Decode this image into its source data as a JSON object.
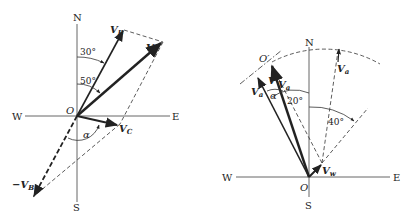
{
  "left_diagram": {
    "compass": {
      "north": "N",
      "south": "S",
      "east": "E",
      "west": "W"
    },
    "origin_label": "O",
    "vectors": {
      "vb": {
        "label": "V",
        "sub": "B"
      },
      "v": {
        "label": "V",
        "sub": ""
      },
      "vc": {
        "label": "V",
        "sub": "C"
      },
      "neg_vb": {
        "prefix": "−",
        "label": "V",
        "sub": "B"
      }
    },
    "angles": {
      "a30": "30°",
      "a50": "50°",
      "alpha": "α"
    }
  },
  "right_diagram": {
    "compass": {
      "north": "N",
      "south": "S",
      "east": "E",
      "west": "W"
    },
    "origin_label": "O",
    "o_prime_label": "O′",
    "vectors": {
      "va_top": {
        "label": "V",
        "sub": "a"
      },
      "va_left": {
        "label": "V",
        "sub": "a"
      },
      "v": {
        "label": "V",
        "sub": ""
      },
      "va_mid": {
        "label": "V",
        "sub": "a"
      },
      "vw": {
        "label": "V",
        "sub": "w"
      }
    },
    "angles": {
      "a20": "20°",
      "a40": "40°",
      "alpha": "α"
    }
  }
}
